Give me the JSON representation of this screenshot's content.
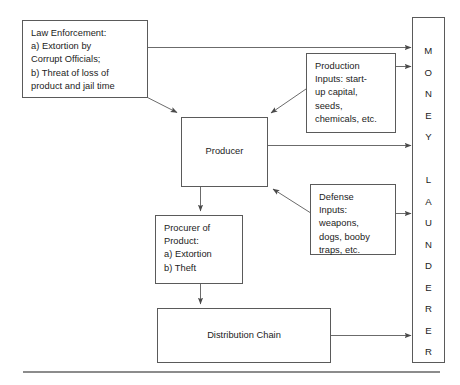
{
  "diagram": {
    "nodes": {
      "law_enforcement": "Law Enforcement:\na) Extortion by\nCorrupt Officials;\nb) Threat of loss of\nproduct and jail time",
      "production_inputs": "Production\nInputs: start-\nup capital,\nseeds,\nchemicals, etc.",
      "defense_inputs": "Defense\nInputs:\nweapons,\ndogs, booby\ntraps, etc.",
      "producer": "Producer",
      "procurer_of_product": "Procurer of\nProduct:\na) Extortion\nb) Theft",
      "distribution_chain": "Distribution Chain",
      "money_launderer": "M\nO\nN\nE\nY\n\nL\nA\nU\nN\nD\nE\nR\nE\nR"
    },
    "edges": [
      {
        "from": "law_enforcement",
        "to": "money_launderer",
        "style": "orthogonal"
      },
      {
        "from": "law_enforcement",
        "to": "producer",
        "style": "diagonal"
      },
      {
        "from": "production_inputs",
        "to": "money_launderer",
        "style": "straight"
      },
      {
        "from": "production_inputs",
        "to": "producer",
        "style": "diagonal"
      },
      {
        "from": "producer",
        "to": "money_launderer",
        "style": "straight"
      },
      {
        "from": "producer",
        "to": "procurer_of_product",
        "style": "straight"
      },
      {
        "from": "defense_inputs",
        "to": "producer",
        "style": "diagonal"
      },
      {
        "from": "defense_inputs",
        "to": "money_launderer",
        "style": "straight"
      },
      {
        "from": "procurer_of_product",
        "to": "distribution_chain",
        "style": "straight"
      },
      {
        "from": "distribution_chain",
        "to": "money_launderer",
        "style": "straight"
      }
    ],
    "colors": {
      "box_border": "#5a5a5a",
      "edge_line": "#6b6b6b",
      "text": "#1c1c1c",
      "background": "#ffffff",
      "baseline_rule": "#8c8c8c"
    }
  }
}
